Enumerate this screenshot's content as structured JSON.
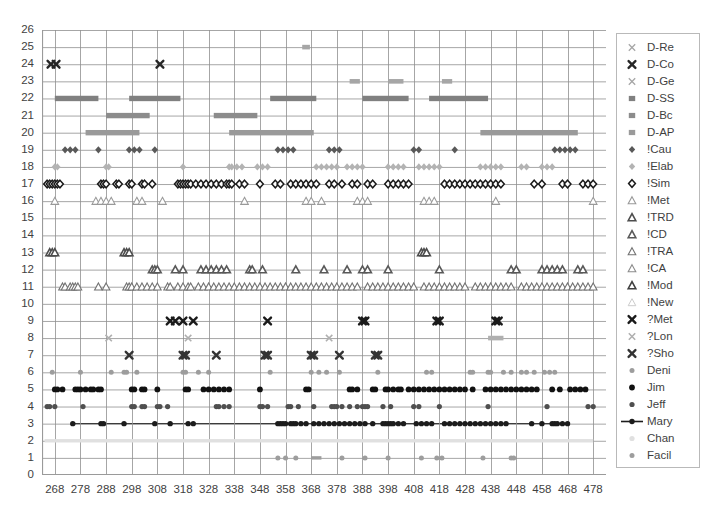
{
  "chart_data": {
    "type": "scatter",
    "title": "",
    "xlabel": "",
    "ylabel": "",
    "xlim": [
      263,
      483
    ],
    "ylim": [
      0,
      26
    ],
    "xticks": [
      268,
      278,
      288,
      298,
      308,
      318,
      328,
      338,
      348,
      358,
      368,
      378,
      388,
      398,
      408,
      418,
      428,
      438,
      448,
      458,
      468,
      478
    ],
    "yticks": [
      0,
      1,
      2,
      3,
      4,
      5,
      6,
      7,
      8,
      9,
      10,
      11,
      12,
      13,
      14,
      15,
      16,
      17,
      18,
      19,
      20,
      21,
      22,
      23,
      24,
      25,
      26
    ],
    "grid": true,
    "legend_position": "right",
    "series": [
      {
        "name": "D-Re",
        "y": 25,
        "marker": "x-thin",
        "color": "#a6a6a6",
        "segments": [
          [
            364.5,
            367.5
          ]
        ],
        "x": []
      },
      {
        "name": "D-Co",
        "y": 24,
        "marker": "x-bold",
        "color": "#262626",
        "segments": [],
        "x": [
          266.5,
          268.5,
          309
        ]
      },
      {
        "name": "D-Ge",
        "y": 23,
        "marker": "x-thin",
        "color": "#a6a6a6",
        "segments": [
          [
            383,
            387
          ],
          [
            398,
            404
          ],
          [
            419,
            423
          ]
        ],
        "x": []
      },
      {
        "name": "D-SS",
        "y": 22,
        "marker": "square",
        "color": "#808080",
        "segments": [
          [
            268,
            285
          ],
          [
            297,
            317
          ],
          [
            352,
            370
          ],
          [
            388,
            406
          ],
          [
            414,
            437
          ]
        ],
        "x": []
      },
      {
        "name": "D-Bc",
        "y": 21,
        "marker": "square",
        "color": "#8c8c8c",
        "segments": [
          [
            288,
            305
          ],
          [
            330,
            347
          ]
        ],
        "x": []
      },
      {
        "name": "D-AP",
        "y": 20,
        "marker": "square",
        "color": "#9a9a9a",
        "segments": [
          [
            280,
            301
          ],
          [
            336,
            369
          ],
          [
            434,
            472
          ]
        ],
        "x": []
      },
      {
        "name": "!Cau",
        "y": 19,
        "marker": "diamond-filled",
        "color": "#595959",
        "segments": [],
        "x": [
          272,
          274,
          276,
          285,
          297,
          299,
          301,
          307,
          355,
          357,
          359,
          361,
          375,
          377,
          379,
          408,
          410,
          424,
          463,
          465,
          467,
          469,
          471
        ]
      },
      {
        "name": "!Elab",
        "y": 18,
        "marker": "diamond-light",
        "color": "#b3b3b3",
        "segments": [],
        "x": [
          268,
          269,
          288,
          289,
          318,
          336,
          337,
          339,
          341,
          347,
          349,
          351,
          370,
          372,
          374,
          376,
          378,
          382,
          384,
          386,
          388,
          398,
          400,
          402,
          404,
          410,
          412,
          414,
          416,
          418,
          434,
          436,
          438,
          440,
          442,
          450,
          452,
          458,
          460,
          462
        ]
      },
      {
        "name": "!Sim",
        "y": 17,
        "marker": "diamond-open",
        "color": "#1a1a1a",
        "segments": [],
        "x": [
          265,
          266,
          267,
          268,
          269,
          270,
          286,
          287,
          288,
          292,
          293,
          297,
          298,
          302,
          303,
          306,
          316,
          317,
          318,
          319,
          320,
          321,
          323,
          325,
          327,
          329,
          331,
          333,
          335,
          336,
          337,
          340,
          342,
          348,
          354,
          356,
          360,
          362,
          364,
          366,
          368,
          370,
          375,
          377,
          380,
          384,
          386,
          390,
          392,
          398,
          400,
          402,
          404,
          406,
          420,
          422,
          424,
          426,
          428,
          430,
          432,
          434,
          436,
          438,
          440,
          442,
          455,
          458,
          466,
          468,
          474,
          476,
          478
        ]
      },
      {
        "name": "!Met",
        "y": 16,
        "marker": "triangle-open",
        "color": "#999999",
        "segments": [],
        "x": [
          268,
          284,
          286,
          288,
          290,
          300,
          302,
          310,
          342,
          366,
          368,
          372,
          386,
          388,
          390,
          412,
          414,
          416,
          440,
          478
        ]
      },
      {
        "name": "!TRD",
        "y": 13,
        "marker": "triangle-dark",
        "color": "#4d4d4d",
        "segments": [],
        "x": [
          266,
          267,
          268,
          295,
          296,
          297,
          411,
          412,
          413
        ]
      },
      {
        "name": "!CD",
        "y": 12,
        "marker": "triangle-dark",
        "color": "#595959",
        "segments": [],
        "x": [
          306,
          307,
          308,
          315,
          318,
          325,
          327,
          329,
          331,
          333,
          335,
          344,
          345,
          349,
          362,
          373,
          382,
          388,
          390,
          398,
          418,
          446,
          448,
          458,
          460,
          462,
          464,
          466,
          472,
          474
        ]
      },
      {
        "name": "!TRA",
        "y": 11,
        "marker": "triangle-open",
        "color": "#737373",
        "segments": [],
        "x": [
          271,
          272,
          274,
          275,
          276,
          277,
          285,
          288,
          296,
          297,
          298,
          300,
          302,
          304,
          306,
          308,
          312,
          313,
          316,
          318,
          320,
          321,
          324,
          326,
          328,
          330,
          332,
          334,
          336,
          338,
          340,
          342,
          344,
          346,
          348,
          350,
          352,
          354,
          356,
          358,
          360,
          362,
          364,
          366,
          368,
          370,
          372,
          374,
          376,
          378,
          380,
          382,
          384,
          386,
          390,
          392,
          394,
          396,
          398,
          400,
          402,
          404,
          406,
          408,
          412,
          414,
          416,
          418,
          420,
          422,
          424,
          426,
          428,
          432,
          434,
          436,
          438,
          440,
          442,
          444,
          446,
          450,
          452,
          454,
          456,
          458,
          460,
          462,
          464,
          466,
          468,
          470,
          472,
          474,
          476,
          478
        ]
      },
      {
        "name": "!CA",
        "y": 11,
        "marker": "triangle-open",
        "color": "#8c8c8c",
        "segments": [],
        "x": []
      },
      {
        "name": "!Mod",
        "y": 11,
        "marker": "triangle-dark",
        "color": "#404040",
        "segments": [],
        "x": []
      },
      {
        "name": "!New",
        "y": 11,
        "marker": "triangle-light",
        "color": "#cccccc",
        "segments": [],
        "x": []
      },
      {
        "name": "?Met",
        "y": 9,
        "marker": "x-bold",
        "color": "#1a1a1a",
        "segments": [],
        "x": [
          313,
          315,
          318,
          322,
          351,
          388,
          389,
          417,
          418,
          440,
          441
        ]
      },
      {
        "name": "?Lon",
        "y": 8,
        "marker": "x-light",
        "color": "#b0b0b0",
        "segments": [
          [
            437,
            443
          ]
        ],
        "x": [
          289,
          320,
          375
        ]
      },
      {
        "name": "?Sho",
        "y": 7,
        "marker": "x-bold",
        "color": "#333333",
        "segments": [],
        "x": [
          297,
          318,
          319,
          331,
          350,
          351,
          368,
          369,
          379,
          393,
          394
        ]
      },
      {
        "name": "Deni",
        "y": 6,
        "marker": "dot-gray",
        "color": "#9d9d9d",
        "segments": [],
        "x": [
          267,
          278,
          290,
          295,
          296,
          300,
          318,
          319,
          324,
          328,
          352,
          368,
          371,
          374,
          379,
          394,
          413,
          415,
          430,
          431,
          437,
          438,
          443,
          446,
          450,
          452,
          455,
          459,
          461,
          463
        ]
      },
      {
        "name": "Jim",
        "y": 5,
        "marker": "dot-black",
        "color": "#111111",
        "segments": [],
        "x": [
          268,
          269,
          271,
          276,
          277,
          278,
          280,
          282,
          283,
          285,
          286,
          298,
          299,
          302,
          303,
          308,
          319,
          320,
          326,
          328,
          330,
          332,
          334,
          336,
          348,
          366,
          367,
          383,
          384,
          386,
          392,
          393,
          397,
          398,
          400,
          402,
          403,
          406,
          408,
          410,
          412,
          414,
          416,
          418,
          420,
          422,
          424,
          426,
          428,
          431,
          436,
          438,
          440,
          442,
          444,
          446,
          448,
          450,
          452,
          454,
          456,
          462,
          465,
          469,
          471,
          473,
          475
        ]
      },
      {
        "name": "Jeff",
        "y": 4,
        "marker": "dot-dark",
        "color": "#4f4f4f",
        "segments": [],
        "x": [
          265,
          266,
          268,
          279,
          298,
          299,
          302,
          303,
          308,
          309,
          312,
          331,
          332,
          334,
          336,
          348,
          349,
          351,
          359,
          360,
          363,
          369,
          376,
          377,
          378,
          380,
          383,
          386,
          388,
          389,
          390,
          396,
          399,
          408,
          410,
          418,
          437,
          460,
          476,
          478
        ]
      },
      {
        "name": "Mary",
        "y": 3,
        "marker": "dot-line",
        "color": "#1c1c1c",
        "segments": [],
        "x": [
          275,
          286,
          287,
          295,
          307,
          313,
          320,
          322,
          355,
          356,
          357,
          358,
          360,
          361,
          362,
          364,
          366,
          369,
          371,
          373,
          375,
          377,
          379,
          381,
          383,
          385,
          387,
          389,
          392,
          396,
          397,
          398,
          399,
          400,
          402,
          404,
          409,
          411,
          413,
          415,
          420,
          422,
          424,
          426,
          428,
          430,
          432,
          434,
          436,
          438,
          440,
          442,
          444,
          454,
          458,
          462,
          463,
          464,
          466,
          468
        ]
      },
      {
        "name": "Chan",
        "y": 2,
        "marker": "dot-light",
        "color": "#e0e0e0",
        "segments": [
          [
            264,
            478
          ]
        ],
        "x": []
      },
      {
        "name": "Facil",
        "y": 1,
        "marker": "dot-gray",
        "color": "#9d9d9d",
        "segments": [
          [
            368,
            372
          ]
        ],
        "x": [
          355,
          358,
          362,
          380,
          389,
          398,
          411,
          417,
          419,
          435,
          446,
          447
        ]
      }
    ],
    "legend_entries": [
      {
        "label": "D-Re",
        "marker": "x-thin",
        "color": "#a6a6a6"
      },
      {
        "label": "D-Co",
        "marker": "x-bold",
        "color": "#262626"
      },
      {
        "label": "D-Ge",
        "marker": "x-thin",
        "color": "#a6a6a6"
      },
      {
        "label": "D-SS",
        "marker": "square",
        "color": "#808080"
      },
      {
        "label": "D-Bc",
        "marker": "square",
        "color": "#8c8c8c"
      },
      {
        "label": "D-AP",
        "marker": "square",
        "color": "#9a9a9a"
      },
      {
        "label": "!Cau",
        "marker": "diamond-filled",
        "color": "#595959"
      },
      {
        "label": "!Elab",
        "marker": "diamond-light",
        "color": "#b3b3b3"
      },
      {
        "label": "!Sim",
        "marker": "diamond-open",
        "color": "#1a1a1a"
      },
      {
        "label": "!Met",
        "marker": "triangle-open",
        "color": "#999999"
      },
      {
        "label": "!TRD",
        "marker": "triangle-dark",
        "color": "#4d4d4d"
      },
      {
        "label": "!CD",
        "marker": "triangle-dark",
        "color": "#595959"
      },
      {
        "label": "!TRA",
        "marker": "triangle-open",
        "color": "#737373"
      },
      {
        "label": "!CA",
        "marker": "triangle-open",
        "color": "#8c8c8c"
      },
      {
        "label": "!Mod",
        "marker": "triangle-dark",
        "color": "#404040"
      },
      {
        "label": "!New",
        "marker": "triangle-light",
        "color": "#cccccc"
      },
      {
        "label": "?Met",
        "marker": "x-bold",
        "color": "#1a1a1a"
      },
      {
        "label": "?Lon",
        "marker": "x-light",
        "color": "#b0b0b0"
      },
      {
        "label": "?Sho",
        "marker": "x-bold",
        "color": "#333333"
      },
      {
        "label": "Deni",
        "marker": "dot-gray",
        "color": "#9d9d9d"
      },
      {
        "label": "Jim",
        "marker": "dot-black",
        "color": "#111111"
      },
      {
        "label": "Jeff",
        "marker": "dot-dark",
        "color": "#4f4f4f"
      },
      {
        "label": "Mary",
        "marker": "dot-line",
        "color": "#1c1c1c"
      },
      {
        "label": "Chan",
        "marker": "dot-light",
        "color": "#e0e0e0"
      },
      {
        "label": "Facil",
        "marker": "dot-gray",
        "color": "#9d9d9d"
      }
    ]
  },
  "style": {
    "grid_color": "#8f8f8f",
    "axis_color": "#9a9a9a",
    "legend_border": "#b9b9b9",
    "background": "#ffffff",
    "text_color": "#3f3f3f"
  }
}
